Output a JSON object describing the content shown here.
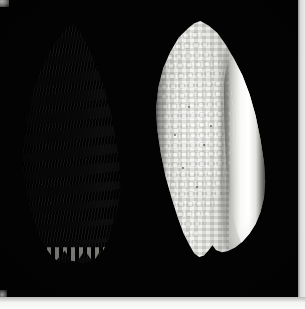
{
  "image": {
    "kind": "specimen-photograph",
    "subject": "two seashells",
    "background_color": "#030303",
    "border_color": "#f4f4f2",
    "width": 305,
    "height": 309,
    "caption": "Two seashells photographed against a black background"
  },
  "specimens": [
    {
      "id": "shell-left",
      "label": "Banded shell, dorsal view",
      "description": "Fusiform shell with pointed spire and dark spiral bands alternating with pale bands; serrated base",
      "view": "dorsal",
      "pattern": "dark spiral banding",
      "light_color": "#d6d6d1",
      "dark_color": "#0a0a0a",
      "band_count": 14,
      "position": {
        "x": 18,
        "y": 24,
        "width": 110,
        "height": 240
      }
    },
    {
      "id": "shell-right",
      "label": "White shell, aperture view",
      "description": "Plain cream-white shell with beaded nodular sculpture, shown from the aperture side with a broad curved outer lip",
      "view": "ventral-aperture",
      "pattern": "beaded nodules",
      "light_color": "#eeeeea",
      "dark_color": "#bcbcb8",
      "position": {
        "x": 150,
        "y": 21,
        "width": 120,
        "height": 236
      }
    }
  ],
  "plate": {
    "photo_area": {
      "x": 0,
      "y": 0,
      "width": 298,
      "height": 297
    },
    "right_edge_strip": {
      "x": 298,
      "width": 7
    },
    "bottom_edge_strip": {
      "y": 297,
      "height": 12
    }
  }
}
